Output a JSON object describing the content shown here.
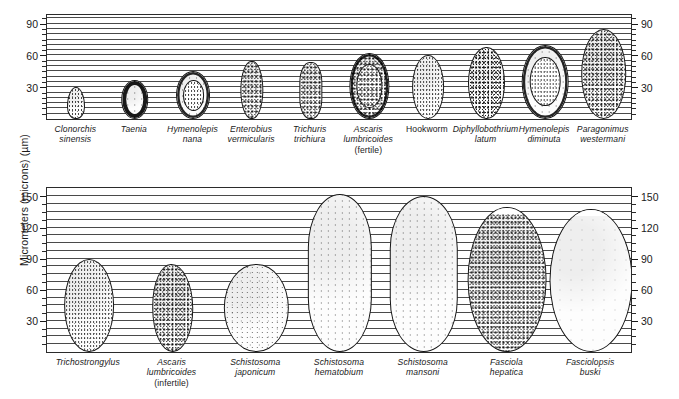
{
  "figure": {
    "yaxis_title": "Micrometers (microns) (µm)",
    "background_color": "#ffffff",
    "line_color": "#2b2b2b"
  },
  "chart_data": {
    "type": "bar",
    "title": "",
    "subtitle": "",
    "xlabel": "",
    "ylabel": "Micrometers (microns) (µm)",
    "grid": true,
    "legend": null,
    "panels": [
      {
        "name": "top-panel",
        "ylim": [
          0,
          100
        ],
        "ytick_labels": [
          "30",
          "60",
          "90"
        ],
        "ytick_values": [
          30,
          60,
          90
        ],
        "minor_gridline_step": 5,
        "left_axis_labels": [
          "90",
          "60",
          "30"
        ],
        "right_axis_labels": [
          "90",
          "60",
          "30"
        ],
        "categories": [
          "Clonorchis sinensis",
          "Taenia",
          "Hymenolepis nana",
          "Enterobius vermicularis",
          "Trichuris trichiura",
          "Ascaris lumbricoides (fertile)",
          "Hookworm",
          "Diphyllobothrium latum",
          "Hymenolepis diminuta",
          "Paragonimus westermani"
        ],
        "values": [
          30,
          37,
          45,
          55,
          54,
          62,
          60,
          68,
          70,
          85
        ],
        "widths": [
          17,
          26,
          32,
          22,
          22,
          37,
          30,
          34,
          44,
          43
        ],
        "specimens": [
          {
            "label_lines": [
              "Clonorchis",
              "sinensis"
            ],
            "height_um": 30,
            "width_um": 17,
            "shape": "ovoid-pointed",
            "texture": "medium",
            "shell": "thin"
          },
          {
            "label_lines": [
              "Taenia"
            ],
            "height_um": 37,
            "width_um": 26,
            "shape": "round",
            "texture": "light",
            "shell": "thick"
          },
          {
            "label_lines": [
              "Hymenolepis",
              "nana"
            ],
            "height_um": 45,
            "width_um": 32,
            "shape": "round",
            "texture": "light",
            "shell": "ring"
          },
          {
            "label_lines": [
              "Enterobius",
              "vermicularis"
            ],
            "height_um": 55,
            "width_um": 22,
            "shape": "oval-flat",
            "texture": "dense",
            "shell": "thin"
          },
          {
            "label_lines": [
              "Trichuris",
              "trichiura"
            ],
            "height_um": 54,
            "width_um": 22,
            "shape": "barrel",
            "texture": "dense",
            "shell": "thin"
          },
          {
            "label_lines": [
              "Ascaris",
              "lumbricoides",
              "(fertile)"
            ],
            "label_plain_index": 2,
            "height_um": 62,
            "width_um": 37,
            "shape": "oval",
            "texture": "dense",
            "shell": "ring"
          },
          {
            "label_lines": [
              "Hookworm"
            ],
            "label_italic": false,
            "height_um": 60,
            "width_um": 30,
            "shape": "oval",
            "texture": "medium",
            "shell": "thin"
          },
          {
            "label_lines": [
              "Diphyllobothrium",
              "latum"
            ],
            "height_um": 68,
            "width_um": 34,
            "shape": "oval",
            "texture": "dense",
            "shell": "thin"
          },
          {
            "label_lines": [
              "Hymenolepis",
              "diminuta"
            ],
            "height_um": 70,
            "width_um": 44,
            "shape": "round",
            "texture": "light",
            "shell": "ring"
          },
          {
            "label_lines": [
              "Paragonimus",
              "westermani"
            ],
            "height_um": 85,
            "width_um": 43,
            "shape": "oval",
            "texture": "dense",
            "shell": "thin"
          }
        ]
      },
      {
        "name": "bottom-panel",
        "ylim": [
          0,
          160
        ],
        "ytick_labels": [
          "30",
          "60",
          "90",
          "120",
          "150"
        ],
        "ytick_values": [
          30,
          60,
          90,
          120,
          150
        ],
        "minor_gridline_step": 7.5,
        "left_axis_labels": [
          "150",
          "120",
          "90",
          "60",
          "30"
        ],
        "right_axis_labels": [
          "150",
          "120",
          "90",
          "60",
          "30"
        ],
        "categories": [
          "Trichostrongylus",
          "Ascaris lumbricoides (infertile)",
          "Schistosoma japonicum",
          "Schistosoma hematobium",
          "Schistosoma mansoni",
          "Fasciola hepatica",
          "Fasciolopsis buski"
        ],
        "values": [
          90,
          85,
          85,
          152,
          150,
          140,
          138
        ],
        "widths": [
          48,
          40,
          62,
          62,
          66,
          76,
          80
        ],
        "specimens": [
          {
            "label_lines": [
              "Trichostrongylus"
            ],
            "height_um": 90,
            "width_um": 48,
            "shape": "oval",
            "texture": "medium",
            "shell": "thin"
          },
          {
            "label_lines": [
              "Ascaris",
              "lumbricoides",
              "(infertile)"
            ],
            "label_plain_index": 2,
            "height_um": 85,
            "width_um": 40,
            "shape": "oval-irregular",
            "texture": "dense",
            "shell": "thin"
          },
          {
            "label_lines": [
              "Schistosoma",
              "japonicum"
            ],
            "height_um": 85,
            "width_um": 62,
            "shape": "round",
            "texture": "sparse",
            "shell": "thin"
          },
          {
            "label_lines": [
              "Schistosoma",
              "hematobium"
            ],
            "height_um": 152,
            "width_um": 62,
            "shape": "spindle",
            "texture": "light",
            "shell": "thin"
          },
          {
            "label_lines": [
              "Schistosoma",
              "mansoni"
            ],
            "height_um": 150,
            "width_um": 66,
            "shape": "spindle",
            "texture": "light",
            "shell": "thin"
          },
          {
            "label_lines": [
              "Fasciola",
              "hepatica"
            ],
            "height_um": 140,
            "width_um": 76,
            "shape": "oval-operculate",
            "texture": "dense",
            "shell": "thin"
          },
          {
            "label_lines": [
              "Fasciolopsis",
              "buski"
            ],
            "height_um": 138,
            "width_um": 80,
            "shape": "oval-operculate",
            "texture": "vsparse",
            "shell": "thin"
          }
        ]
      }
    ]
  }
}
